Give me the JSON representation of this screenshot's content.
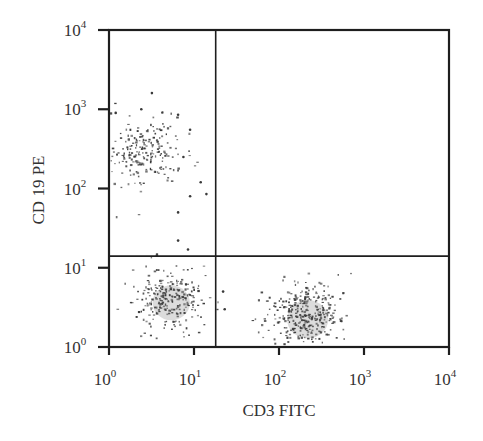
{
  "chart_data": {
    "type": "scatter",
    "subtype": "flow-cytometry-dot-plot",
    "title": "",
    "xlabel": "CD3 FITC",
    "ylabel": "CD 19 PE",
    "xscale": "log",
    "yscale": "log",
    "xlim": [
      1,
      10000
    ],
    "ylim": [
      1,
      10000
    ],
    "x_ticks": [
      {
        "base": "10",
        "exp": "0",
        "value": 1
      },
      {
        "base": "10",
        "exp": "1",
        "value": 10
      },
      {
        "base": "10",
        "exp": "2",
        "value": 100
      },
      {
        "base": "10",
        "exp": "3",
        "value": 1000
      },
      {
        "base": "10",
        "exp": "4",
        "value": 10000
      }
    ],
    "y_ticks": [
      {
        "base": "10",
        "exp": "0",
        "value": 1
      },
      {
        "base": "10",
        "exp": "1",
        "value": 10
      },
      {
        "base": "10",
        "exp": "2",
        "value": 100
      },
      {
        "base": "10",
        "exp": "3",
        "value": 1000
      },
      {
        "base": "10",
        "exp": "4",
        "value": 10000
      }
    ],
    "grid": false,
    "legend": null,
    "quadrant_gates": {
      "x": 18,
      "y": 14
    },
    "quadrants": [
      {
        "position": "upper-left",
        "description": "CD3- CD19+ (B cells)",
        "populated": true
      },
      {
        "position": "upper-right",
        "description": "CD3+ CD19+",
        "populated": false
      },
      {
        "position": "lower-left",
        "description": "CD3- CD19- (double negative)",
        "populated": true
      },
      {
        "position": "lower-right",
        "description": "CD3+ CD19- (T cells)",
        "populated": true
      }
    ],
    "series": [
      {
        "name": "B cells (CD19+)",
        "center_x": 2.7,
        "center_y": 300,
        "spread_log_x": 0.22,
        "spread_log_y": 0.2,
        "n": 220,
        "dense_core": false
      },
      {
        "name": "Double negative",
        "center_x": 5,
        "center_y": 4,
        "spread_log_x": 0.2,
        "spread_log_y": 0.2,
        "n": 260,
        "dense_core": true
      },
      {
        "name": "T cells (CD3+)",
        "center_x": 200,
        "center_y": 2.5,
        "spread_log_x": 0.22,
        "spread_log_y": 0.22,
        "n": 340,
        "dense_core": true
      }
    ],
    "outliers": [
      {
        "x": 3.2,
        "y": 1600
      },
      {
        "x": 2.4,
        "y": 1000
      },
      {
        "x": 1.2,
        "y": 900
      },
      {
        "x": 6.5,
        "y": 850
      },
      {
        "x": 9,
        "y": 550
      },
      {
        "x": 7.5,
        "y": 250
      },
      {
        "x": 14,
        "y": 85
      },
      {
        "x": 6.5,
        "y": 50
      },
      {
        "x": 6.5,
        "y": 22
      },
      {
        "x": 8.5,
        "y": 17
      },
      {
        "x": 22,
        "y": 5
      },
      {
        "x": 23,
        "y": 3
      },
      {
        "x": 12,
        "y": 120
      },
      {
        "x": 9,
        "y": 80
      }
    ]
  },
  "colors": {
    "axis": "#1e1e1e",
    "dots": "#3a3a3a",
    "core": "#9a9a9a",
    "background": "#ffffff"
  }
}
